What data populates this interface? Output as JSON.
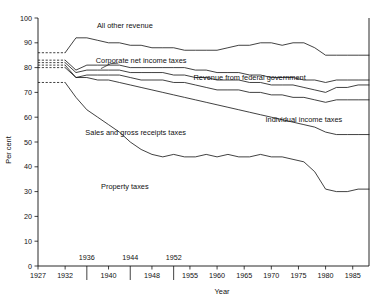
{
  "chart_data": {
    "type": "area",
    "title": "",
    "xlabel": "Year",
    "ylabel": "Per cent",
    "ylim": [
      0,
      100
    ],
    "xlim": [
      1927,
      1988
    ],
    "grid": false,
    "legend_position": "inline-annotations",
    "ytick_labels": [
      "0",
      "10",
      "20",
      "30",
      "40",
      "50",
      "60",
      "70",
      "80",
      "90",
      "100"
    ],
    "ytick_values": [
      0,
      10,
      20,
      30,
      40,
      50,
      60,
      70,
      80,
      90,
      100
    ],
    "xtick_values": [
      1927,
      1932,
      1936,
      1940,
      1944,
      1948,
      1952,
      1955,
      1960,
      1965,
      1970,
      1975,
      1980,
      1985
    ],
    "xtick_labels": [
      "1927",
      "1932",
      "1936",
      "1940",
      "1944",
      "1948",
      "1952",
      "1955",
      "1960",
      "1965",
      "1970",
      "1975",
      "1980",
      "1985"
    ],
    "xtick_rows": [
      0,
      0,
      1,
      0,
      1,
      0,
      1,
      0,
      0,
      0,
      0,
      0,
      0,
      0
    ],
    "annotations": [
      {
        "text": "All other revenue",
        "x": 1943,
        "y": 96
      },
      {
        "text": "Corporate net income taxes",
        "x": 1946,
        "y": 82
      },
      {
        "text": "Revenue from federal government",
        "x": 1966,
        "y": 75
      },
      {
        "text": "Individual income taxes",
        "x": 1976,
        "y": 58
      },
      {
        "text": "Sales and gross receipts taxes",
        "x": 1945,
        "y": 53
      },
      {
        "text": "Property taxes",
        "x": 1943,
        "y": 31
      }
    ],
    "x": [
      1927,
      1932,
      1934,
      1936,
      1938,
      1940,
      1942,
      1944,
      1946,
      1948,
      1950,
      1952,
      1954,
      1956,
      1958,
      1960,
      1962,
      1964,
      1966,
      1968,
      1970,
      1972,
      1974,
      1976,
      1978,
      1980,
      1982,
      1984,
      1986,
      1988
    ],
    "series": [
      {
        "name": "All other revenue",
        "note": "Upper boundary of cumulative stack (below 100 = all other revenue band)",
        "dashed_from": 1927,
        "dashed_to": 1932,
        "values": [
          86,
          86,
          92,
          92,
          91,
          90,
          90,
          89,
          89,
          88,
          88,
          88,
          87,
          87,
          87,
          87,
          88,
          89,
          89,
          90,
          90,
          89,
          90,
          90,
          88,
          85,
          85,
          85,
          85,
          85
        ]
      },
      {
        "name": "Corporate net income taxes",
        "dashed_from": 1927,
        "dashed_to": 1932,
        "values": [
          83,
          83,
          79,
          81,
          81,
          81,
          81,
          80,
          80,
          80,
          80,
          80,
          80,
          79,
          79,
          78,
          78,
          78,
          77,
          77,
          76,
          76,
          76,
          75,
          75,
          74,
          75,
          75,
          75,
          75
        ]
      },
      {
        "name": "Revenue from federal government",
        "dashed_from": 1927,
        "dashed_to": 1932,
        "values": [
          82,
          82,
          78,
          79,
          79,
          79,
          79,
          78,
          78,
          78,
          78,
          77,
          77,
          76,
          76,
          75,
          75,
          75,
          74,
          74,
          73,
          73,
          73,
          72,
          71,
          70,
          72,
          72,
          73,
          73
        ]
      },
      {
        "name": "Individual income taxes",
        "dashed_from": 1927,
        "dashed_to": 1932,
        "values": [
          81,
          81,
          76,
          77,
          77,
          77,
          77,
          76,
          75,
          75,
          75,
          74,
          74,
          73,
          72,
          71,
          71,
          71,
          70,
          70,
          69,
          69,
          68,
          68,
          67,
          66,
          67,
          67,
          67,
          67
        ]
      },
      {
        "name": "Sales and gross receipts taxes",
        "dashed_from": 1927,
        "dashed_to": 1932,
        "values": [
          80,
          80,
          76,
          76,
          75,
          75,
          74,
          73,
          72,
          71,
          70,
          69,
          68,
          67,
          66,
          65,
          64,
          63,
          62,
          61,
          60,
          59,
          58,
          57,
          56,
          54,
          53,
          53,
          53,
          53
        ]
      },
      {
        "name": "Property taxes",
        "dashed_from": 1927,
        "dashed_to": 1932,
        "values": [
          74,
          74,
          68,
          63,
          60,
          57,
          54,
          50,
          47,
          45,
          44,
          45,
          44,
          44,
          45,
          44,
          45,
          44,
          44,
          45,
          44,
          44,
          43,
          42,
          38,
          31,
          30,
          30,
          31,
          31
        ]
      }
    ]
  },
  "axes": {
    "y_title": "Per cent",
    "x_title": "Year"
  }
}
